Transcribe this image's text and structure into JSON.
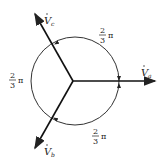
{
  "diagram": {
    "phasors": [
      {
        "id": "va",
        "label": "V",
        "subscript": "a",
        "tip": [
          155,
          81
        ]
      },
      {
        "id": "vb",
        "label": "V",
        "subscript": "b",
        "tip": [
          35,
          148
        ]
      },
      {
        "id": "vc",
        "label": "V",
        "subscript": "c",
        "tip": [
          35,
          14
        ]
      }
    ],
    "origin": [
      73,
      81
    ],
    "angles": [
      {
        "num": "2",
        "den": "3",
        "sym": "π",
        "pos": "top-right"
      },
      {
        "num": "2",
        "den": "3",
        "sym": "π",
        "pos": "left"
      },
      {
        "num": "2",
        "den": "3",
        "sym": "π",
        "pos": "bottom-right"
      }
    ],
    "colors": {
      "stroke": "#222222",
      "background": "#ffffff"
    }
  }
}
